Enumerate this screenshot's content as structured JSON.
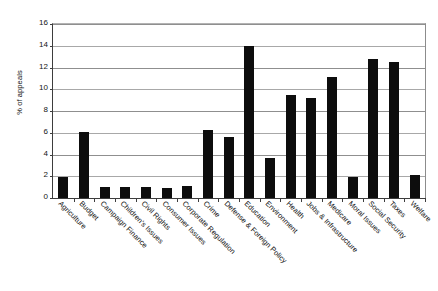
{
  "chart_data": {
    "type": "bar",
    "title": "",
    "xlabel": "",
    "ylabel": "% of appeals",
    "ylim": [
      0,
      16
    ],
    "ytick_values": [
      0,
      2,
      4,
      6,
      8,
      10,
      12,
      14,
      16
    ],
    "ytick_labels": [
      "0",
      "2",
      "4",
      "6",
      "8",
      "10",
      "12",
      "14",
      "16"
    ],
    "grid": "horizontal",
    "legend": "none",
    "bar_color": "#0d0d0d",
    "categories": [
      "Agriculture",
      "Budget",
      "Campaign Finance",
      "Children's Issues",
      "Civil Rights",
      "Consumer Issues",
      "Corporate Regulation",
      "Crime",
      "Defense & Foreign Policy",
      "Education",
      "Environment",
      "Health",
      "Jobs & Infrastructure",
      "Medicare",
      "Moral Issues",
      "Social Security",
      "Taxes",
      "Welfare"
    ],
    "values": [
      1.9,
      6.1,
      1.05,
      1.0,
      1.05,
      0.9,
      1.15,
      6.3,
      5.6,
      14.0,
      3.65,
      9.5,
      9.2,
      11.1,
      1.95,
      12.75,
      12.5,
      2.15
    ]
  }
}
